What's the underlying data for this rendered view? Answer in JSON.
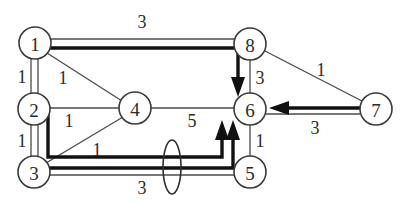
{
  "figure": {
    "kind": "weighted-undirected-graph-with-flow-augmenting-path",
    "background_color": "#ffffff",
    "node_stroke_color": "#3a3a3a",
    "thin_edge_color": "#4a4a4a",
    "thick_edge_color": "#111111",
    "label_color": "#2b2b2b"
  },
  "nodes": [
    {
      "id": "1",
      "label": "1",
      "cx": 35,
      "cy": 43,
      "r": 16
    },
    {
      "id": "2",
      "label": "2",
      "cx": 34,
      "cy": 109,
      "r": 16
    },
    {
      "id": "3",
      "label": "3",
      "cx": 34,
      "cy": 172,
      "r": 16
    },
    {
      "id": "4",
      "label": "4",
      "cx": 135,
      "cy": 108,
      "r": 16
    },
    {
      "id": "5",
      "label": "5",
      "cx": 250,
      "cy": 172,
      "r": 16
    },
    {
      "id": "6",
      "label": "6",
      "cx": 250,
      "cy": 109,
      "r": 16
    },
    {
      "id": "7",
      "label": "7",
      "cx": 376,
      "cy": 109,
      "r": 16
    },
    {
      "id": "8",
      "label": "8",
      "cx": 250,
      "cy": 44,
      "r": 16
    }
  ],
  "edges": [
    {
      "id": "e-1-8",
      "from": "1",
      "to": "8",
      "weight": "3",
      "label_x": 142,
      "label_y": 22
    },
    {
      "id": "e-1-2",
      "from": "1",
      "to": "2",
      "weight": "1",
      "label_x": 22,
      "label_y": 77
    },
    {
      "id": "e-1-4",
      "from": "1",
      "to": "4",
      "weight": "1",
      "label_x": 63,
      "label_y": 78
    },
    {
      "id": "e-2-3",
      "from": "2",
      "to": "3",
      "weight": "1",
      "label_x": 22,
      "label_y": 141
    },
    {
      "id": "e-2-4",
      "from": "2",
      "to": "4",
      "weight": "1",
      "label_x": 69,
      "label_y": 121
    },
    {
      "id": "e-3-4",
      "from": "3",
      "to": "4",
      "weight": "1",
      "label_x": 97,
      "label_y": 150
    },
    {
      "id": "e-3-5",
      "from": "3",
      "to": "5",
      "weight": "3",
      "label_x": 142,
      "label_y": 188
    },
    {
      "id": "e-4-6",
      "from": "4",
      "to": "6",
      "weight": "5",
      "label_x": 192,
      "label_y": 121
    },
    {
      "id": "e-8-6",
      "from": "8",
      "to": "6",
      "weight": "3",
      "label_x": 260,
      "label_y": 78
    },
    {
      "id": "e-8-7",
      "from": "8",
      "to": "7",
      "weight": "1",
      "label_x": 321,
      "label_y": 70
    },
    {
      "id": "e-6-5",
      "from": "6",
      "to": "5",
      "weight": "1",
      "label_x": 260,
      "label_y": 141
    },
    {
      "id": "e-6-7",
      "from": "6",
      "to": "7",
      "weight": "3",
      "label_x": 315,
      "label_y": 128
    }
  ],
  "flow_paths": [
    {
      "id": "path-1-8-6",
      "description": "1 to 8 to 6",
      "directed": true
    },
    {
      "id": "path-2-3-5-6",
      "description": "2 down to 3 level then right to 5 then up to 6",
      "directed": true
    },
    {
      "id": "path-3-5-6",
      "description": "3 right to 5 then up to 6",
      "directed": true
    },
    {
      "id": "path-7-6",
      "description": "7 to 6",
      "directed": true
    }
  ],
  "cut_marker": {
    "id": "cut-ellipse",
    "cx": 172,
    "cy": 167,
    "rx": 9,
    "ry": 27
  }
}
